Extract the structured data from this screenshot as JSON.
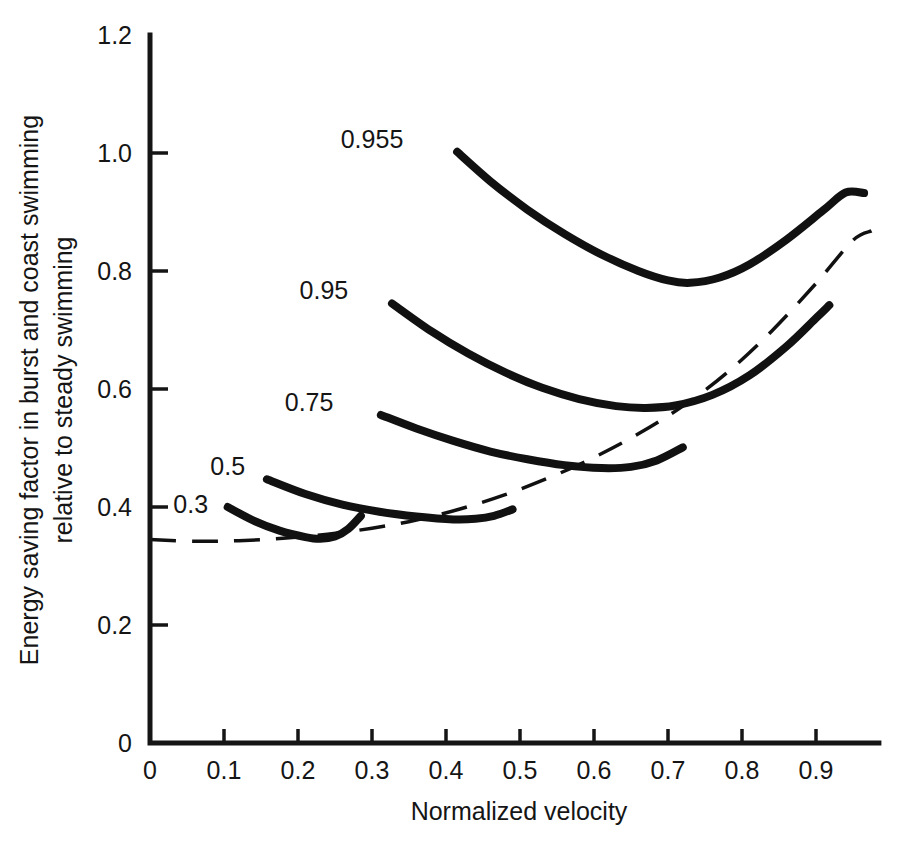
{
  "chart_data": {
    "type": "line",
    "title": "",
    "xlabel": "Normalized velocity",
    "ylabel": "Energy saving factor in burst and coast swimming relative to steady swimming",
    "ylabel_line1": "Energy saving factor in burst and coast swimming",
    "ylabel_line2": "relative to steady swimming",
    "xlim": [
      0,
      0.985
    ],
    "ylim": [
      0,
      1.2
    ],
    "grid": false,
    "legend": "inline curve labels at left end of each curve",
    "xticks": [
      0,
      0.1,
      0.2,
      0.3,
      0.4,
      0.5,
      0.6,
      0.7,
      0.8,
      0.9
    ],
    "xticklabels": [
      "0",
      "0.1",
      "0.2",
      "0.3",
      "0.4",
      "0.5",
      "0.6",
      "0.7",
      "0.8",
      "0.9"
    ],
    "yticks": [
      0,
      0.2,
      0.4,
      0.6,
      0.8,
      1.0,
      1.2
    ],
    "yticklabels": [
      "0",
      "0.2",
      "0.4",
      "0.6",
      "0.8",
      "1.0",
      "1.2"
    ],
    "series": [
      {
        "name": "0.3",
        "label": "0.3",
        "style": "solid",
        "label_x": 0.055,
        "label_y": 0.405,
        "points": [
          [
            0.105,
            0.4
          ],
          [
            0.14,
            0.377
          ],
          [
            0.175,
            0.36
          ],
          [
            0.21,
            0.349
          ],
          [
            0.23,
            0.346
          ],
          [
            0.25,
            0.35
          ],
          [
            0.268,
            0.363
          ],
          [
            0.285,
            0.385
          ]
        ]
      },
      {
        "name": "0.5",
        "label": "0.5",
        "style": "solid",
        "label_x": 0.105,
        "label_y": 0.47,
        "points": [
          [
            0.158,
            0.447
          ],
          [
            0.21,
            0.422
          ],
          [
            0.26,
            0.404
          ],
          [
            0.31,
            0.392
          ],
          [
            0.36,
            0.384
          ],
          [
            0.41,
            0.379
          ],
          [
            0.44,
            0.38
          ],
          [
            0.465,
            0.385
          ],
          [
            0.49,
            0.396
          ]
        ]
      },
      {
        "name": "0.75",
        "label": "0.75",
        "style": "solid",
        "label_x": 0.215,
        "label_y": 0.578,
        "points": [
          [
            0.312,
            0.556
          ],
          [
            0.36,
            0.533
          ],
          [
            0.41,
            0.512
          ],
          [
            0.46,
            0.494
          ],
          [
            0.51,
            0.481
          ],
          [
            0.56,
            0.471
          ],
          [
            0.61,
            0.466
          ],
          [
            0.65,
            0.468
          ],
          [
            0.685,
            0.479
          ],
          [
            0.72,
            0.501
          ]
        ]
      },
      {
        "name": "0.95",
        "label": "0.95",
        "style": "solid",
        "label_x": 0.235,
        "label_y": 0.768,
        "points": [
          [
            0.327,
            0.745
          ],
          [
            0.38,
            0.698
          ],
          [
            0.43,
            0.66
          ],
          [
            0.48,
            0.628
          ],
          [
            0.53,
            0.602
          ],
          [
            0.58,
            0.583
          ],
          [
            0.63,
            0.571
          ],
          [
            0.67,
            0.568
          ],
          [
            0.71,
            0.572
          ],
          [
            0.76,
            0.59
          ],
          [
            0.81,
            0.623
          ],
          [
            0.86,
            0.672
          ],
          [
            0.9,
            0.72
          ],
          [
            0.918,
            0.742
          ]
        ]
      },
      {
        "name": "0.955",
        "label": "0.955",
        "style": "solid",
        "label_x": 0.3,
        "label_y": 1.023,
        "points": [
          [
            0.415,
            1.002
          ],
          [
            0.46,
            0.952
          ],
          [
            0.51,
            0.904
          ],
          [
            0.56,
            0.863
          ],
          [
            0.61,
            0.828
          ],
          [
            0.66,
            0.8
          ],
          [
            0.7,
            0.784
          ],
          [
            0.73,
            0.78
          ],
          [
            0.77,
            0.789
          ],
          [
            0.81,
            0.811
          ],
          [
            0.86,
            0.853
          ],
          [
            0.91,
            0.903
          ],
          [
            0.94,
            0.933
          ],
          [
            0.965,
            0.932
          ]
        ]
      },
      {
        "name": "reference-dashed",
        "label": "",
        "style": "dashed",
        "points": [
          [
            0.0,
            0.345
          ],
          [
            0.06,
            0.342
          ],
          [
            0.12,
            0.343
          ],
          [
            0.18,
            0.347
          ],
          [
            0.24,
            0.354
          ],
          [
            0.3,
            0.364
          ],
          [
            0.36,
            0.378
          ],
          [
            0.42,
            0.397
          ],
          [
            0.48,
            0.421
          ],
          [
            0.54,
            0.45
          ],
          [
            0.6,
            0.484
          ],
          [
            0.66,
            0.524
          ],
          [
            0.72,
            0.571
          ],
          [
            0.78,
            0.628
          ],
          [
            0.84,
            0.698
          ],
          [
            0.9,
            0.779
          ],
          [
            0.95,
            0.852
          ],
          [
            0.975,
            0.868
          ]
        ]
      }
    ]
  }
}
